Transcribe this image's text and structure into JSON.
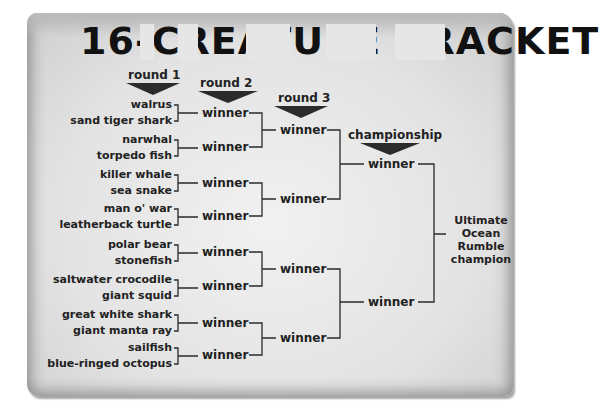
{
  "title": {
    "full_text": "16-CREATURE BRACKET",
    "visible_fragments": [
      "16-",
      "‘",
      "P",
      "‒",
      "A",
      "T",
      "”",
      "‒",
      "B",
      "A",
      "‘",
      "‒",
      "T"
    ]
  },
  "headers": {
    "round1": "round 1",
    "round2": "round 2",
    "round3": "round 3",
    "championship": "championship"
  },
  "round1": {
    "matchups": [
      [
        "walrus",
        "sand tiger shark"
      ],
      [
        "narwhal",
        "torpedo fish"
      ],
      [
        "killer whale",
        "sea snake"
      ],
      [
        "man o' war",
        "leatherback turtle"
      ],
      [
        "polar bear",
        "stonefish"
      ],
      [
        "saltwater crocodile",
        "giant squid"
      ],
      [
        "great white shark",
        "giant manta ray"
      ],
      [
        "sailfish",
        "blue-ringed octopus"
      ]
    ]
  },
  "round2": {
    "slots": [
      "winner",
      "winner",
      "winner",
      "winner",
      "winner",
      "winner",
      "winner",
      "winner"
    ]
  },
  "round3": {
    "slots": [
      "winner",
      "winner",
      "winner",
      "winner"
    ]
  },
  "championship": {
    "slots": [
      "winner",
      "winner"
    ]
  },
  "champion": {
    "lines": [
      "Ultimate",
      "Ocean",
      "Rumble",
      "champion"
    ]
  },
  "colors": {
    "paper": "#e4e4e4",
    "ink": "#222222",
    "arrow": "#2b2b2b"
  }
}
